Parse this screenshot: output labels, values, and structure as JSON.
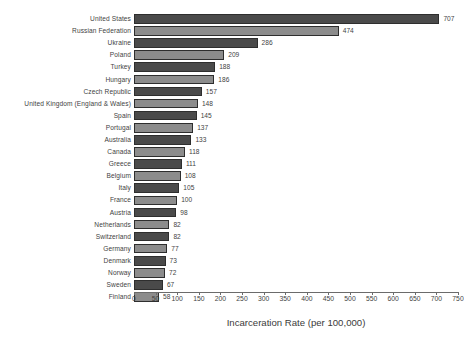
{
  "chart_data": {
    "type": "bar",
    "orientation": "horizontal",
    "title": "",
    "xlabel": "Incarceration Rate (per 100,000)",
    "ylabel": "",
    "xlim": [
      0,
      750
    ],
    "xticks": [
      0,
      50,
      100,
      150,
      200,
      250,
      300,
      350,
      400,
      450,
      500,
      550,
      600,
      650,
      700,
      750
    ],
    "grid": false,
    "legend": null,
    "value_labels_shown": true,
    "bar_colors": {
      "dark": "#4a4a4a",
      "light": "#8c8c8c",
      "edge": "#2e2e2e",
      "pattern": "alternating rows"
    },
    "categories": [
      "United States",
      "Russian Federation",
      "Ukraine",
      "Poland",
      "Turkey",
      "Hungary",
      "Czech Republic",
      "United Kingdom (England & Wales)",
      "Spain",
      "Portugal",
      "Australia",
      "Canada",
      "Greece",
      "Belgium",
      "Italy",
      "France",
      "Austria",
      "Netherlands",
      "Switzerland",
      "Germany",
      "Denmark",
      "Norway",
      "Sweden",
      "Finland"
    ],
    "values": [
      707,
      474,
      286,
      209,
      188,
      186,
      157,
      148,
      145,
      137,
      133,
      118,
      111,
      108,
      105,
      100,
      98,
      82,
      82,
      77,
      73,
      72,
      67,
      58
    ]
  },
  "axis": {
    "title": "Incarceration Rate (per 100,000)"
  }
}
